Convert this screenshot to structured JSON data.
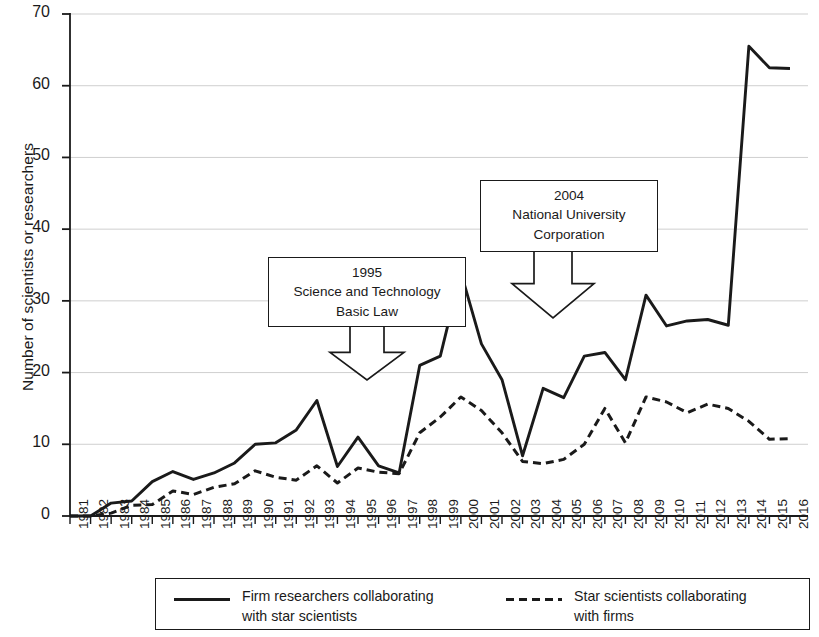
{
  "chart_data": {
    "type": "line",
    "title": "",
    "xlabel": "",
    "ylabel": "Number of scientists or researchers",
    "ylim": [
      0,
      70
    ],
    "ytick_values": [
      0,
      10,
      20,
      30,
      40,
      50,
      60,
      70
    ],
    "ytick_labels": [
      "0",
      "10",
      "20",
      "30",
      "40",
      "50",
      "60",
      "70"
    ],
    "grid": "horizontal",
    "legend_position": "below-axes",
    "x": [
      1981,
      1982,
      1983,
      1984,
      1985,
      1986,
      1987,
      1988,
      1989,
      1990,
      1991,
      1992,
      1993,
      1994,
      1995,
      1996,
      1997,
      1998,
      1999,
      2000,
      2001,
      2002,
      2003,
      2004,
      2005,
      2006,
      2007,
      2008,
      2009,
      2010,
      2011,
      2012,
      2013,
      2014,
      2015,
      2016
    ],
    "categories": [
      "1981",
      "1982",
      "1983",
      "1984",
      "1985",
      "1986",
      "1987",
      "1988",
      "1989",
      "1990",
      "1991",
      "1992",
      "1993",
      "1994",
      "1995",
      "1996",
      "1997",
      "1998",
      "1999",
      "2000",
      "2001",
      "2002",
      "2003",
      "2004",
      "2005",
      "2006",
      "2007",
      "2008",
      "2009",
      "2010",
      "2011",
      "2012",
      "2013",
      "2014",
      "2015",
      "2016"
    ],
    "series": [
      {
        "name": "Firm researchers collaborating with star scientists",
        "style": "solid",
        "color": "#1a1a1a",
        "values": [
          0,
          0,
          1.8,
          2.1,
          4.8,
          6.2,
          5.1,
          6.0,
          7.4,
          10.0,
          10.2,
          12.0,
          16.1,
          6.9,
          11.0,
          7.0,
          6.0,
          21.0,
          22.3,
          34.0,
          24.0,
          19.0,
          8.4,
          17.8,
          16.5,
          22.3,
          22.8,
          19.0,
          30.8,
          26.5,
          27.2,
          27.4,
          26.6,
          65.5,
          62.5,
          62.4
        ]
      },
      {
        "name": "Star scientists collaborating with firms",
        "style": "dashed",
        "color": "#1a1a1a",
        "values": [
          0,
          0,
          0.4,
          1.5,
          1.6,
          3.5,
          3.0,
          4.0,
          4.5,
          6.3,
          5.4,
          5.0,
          7.0,
          4.6,
          6.7,
          6.1,
          5.9,
          11.6,
          13.8,
          16.6,
          14.7,
          11.6,
          7.6,
          7.3,
          7.9,
          10.0,
          15.0,
          10.2,
          16.6,
          15.9,
          14.4,
          15.6,
          15.0,
          13.2,
          10.7,
          10.8
        ]
      }
    ],
    "annotations": [
      {
        "id": "annotation-1995",
        "lines": [
          "1995",
          "Science and Technology",
          "Basic Law"
        ],
        "points_to_year": 1995
      },
      {
        "id": "annotation-2004",
        "lines": [
          "2004",
          "National University",
          "Corporation"
        ],
        "points_to_year": 2004
      }
    ]
  },
  "legend": {
    "entries": [
      {
        "label": "Firm researchers collaborating\nwith star scientists",
        "style": "solid"
      },
      {
        "label": "Star scientists collaborating\nwith firms",
        "style": "dashed"
      }
    ]
  }
}
